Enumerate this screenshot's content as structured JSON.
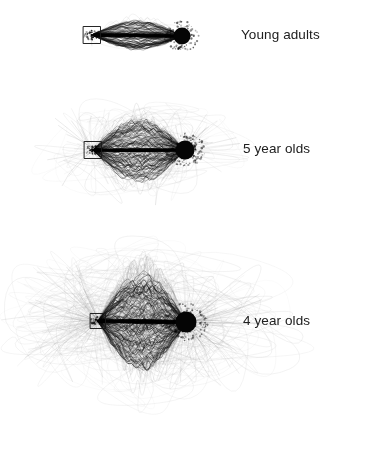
{
  "figure": {
    "background_color": "#ffffff",
    "width": 367,
    "height": 467,
    "marker_colors": {
      "start_square_stroke": "#1a1a1a",
      "target_circle_fill": "#050505",
      "trajectory_dark": "#111111",
      "trajectory_faint": "#bdbdbd"
    }
  },
  "panels": [
    {
      "id": "young-adults",
      "label": "Young adults",
      "label_x": 241,
      "label_y": 27,
      "start_marker": {
        "shape": "square",
        "x": 92,
        "y": 35,
        "size": 17
      },
      "target_marker": {
        "shape": "circle",
        "x": 182,
        "y": 36,
        "radius": 8.5
      },
      "spread": "tight",
      "bundle_count": 90,
      "stray_count": 4,
      "lateral_spread_px": 14,
      "stray_spread_px": 26,
      "center_y": 36
    },
    {
      "id": "5-year-olds",
      "label": "5 year olds",
      "label_x": 243,
      "label_y": 141,
      "start_marker": {
        "shape": "square",
        "x": 93,
        "y": 150,
        "size": 17
      },
      "target_marker": {
        "shape": "circle",
        "x": 185,
        "y": 150,
        "radius": 9.5
      },
      "spread": "moderate",
      "bundle_count": 120,
      "stray_count": 34,
      "lateral_spread_px": 30,
      "stray_spread_px": 105,
      "center_y": 150
    },
    {
      "id": "4-year-olds",
      "label": "4 year olds",
      "label_x": 243,
      "label_y": 313,
      "start_marker": {
        "shape": "square",
        "x": 98,
        "y": 321,
        "size": 15
      },
      "target_marker": {
        "shape": "circle",
        "x": 186,
        "y": 322,
        "radius": 10.5
      },
      "spread": "wide",
      "bundle_count": 130,
      "stray_count": 90,
      "lateral_spread_px": 45,
      "stray_spread_px": 165,
      "center_y": 322
    }
  ],
  "chart_data": {
    "type": "scatter",
    "title": "",
    "xlabel": "",
    "ylabel": "",
    "series": [
      {
        "name": "Young adults",
        "trajectories": 94,
        "dispersion_index": 1.0
      },
      {
        "name": "5 year olds",
        "trajectories": 154,
        "dispersion_index": 3.6
      },
      {
        "name": "4 year olds",
        "trajectories": 220,
        "dispersion_index": 6.4
      }
    ],
    "legend_position": "right",
    "grid": false
  }
}
